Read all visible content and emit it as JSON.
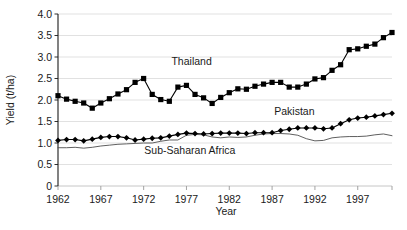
{
  "chart_data": {
    "type": "line",
    "title": "",
    "xlabel": "Year",
    "ylabel": "Yield (t/ha)",
    "xlim": [
      1962,
      2001
    ],
    "ylim": [
      0,
      4.0
    ],
    "grid": true,
    "grid_axis": "y",
    "legend": "inline-annotations",
    "y_ticks": [
      "0",
      "0.5",
      "1.0",
      "1.5",
      "2.0",
      "2.5",
      "3.0",
      "3.5",
      "4.0"
    ],
    "y_tick_values": [
      0,
      0.5,
      1.0,
      1.5,
      2.0,
      2.5,
      3.0,
      3.5,
      4.0
    ],
    "x_ticks": [
      "1962",
      "1967",
      "1972",
      "1977",
      "1982",
      "1987",
      "1992",
      "1997"
    ],
    "x_tick_values": [
      1962,
      1967,
      1972,
      1977,
      1982,
      1987,
      1992,
      1997
    ],
    "x": [
      1962,
      1963,
      1964,
      1965,
      1966,
      1967,
      1968,
      1969,
      1970,
      1971,
      1972,
      1973,
      1974,
      1975,
      1976,
      1977,
      1978,
      1979,
      1980,
      1981,
      1982,
      1983,
      1984,
      1985,
      1986,
      1987,
      1988,
      1989,
      1990,
      1991,
      1992,
      1993,
      1994,
      1995,
      1996,
      1997,
      1998,
      1999,
      2000,
      2001
    ],
    "series": [
      {
        "name": "Thailand",
        "marker": "square",
        "color": "#000000",
        "label_x": 1977.6,
        "label_y": 2.82,
        "values": [
          2.1,
          2.02,
          1.97,
          1.93,
          1.81,
          1.93,
          2.03,
          2.14,
          2.24,
          2.41,
          2.5,
          2.13,
          2.01,
          1.97,
          2.3,
          2.34,
          2.13,
          2.05,
          1.92,
          2.06,
          2.17,
          2.26,
          2.25,
          2.32,
          2.37,
          2.41,
          2.41,
          2.3,
          2.3,
          2.37,
          2.49,
          2.52,
          2.69,
          2.82,
          3.17,
          3.19,
          3.25,
          3.3,
          3.45,
          3.57
        ]
      },
      {
        "name": "Pakistan",
        "marker": "diamond",
        "color": "#000000",
        "label_x": 1989.6,
        "label_y": 1.65,
        "values": [
          1.06,
          1.08,
          1.08,
          1.05,
          1.09,
          1.13,
          1.15,
          1.15,
          1.12,
          1.07,
          1.09,
          1.11,
          1.12,
          1.16,
          1.2,
          1.23,
          1.22,
          1.21,
          1.22,
          1.23,
          1.23,
          1.23,
          1.22,
          1.24,
          1.24,
          1.24,
          1.29,
          1.32,
          1.35,
          1.35,
          1.35,
          1.33,
          1.35,
          1.45,
          1.54,
          1.58,
          1.6,
          1.63,
          1.66,
          1.69
        ]
      },
      {
        "name": "Sub-Saharan Africa",
        "marker": "none",
        "color": "#4d4d4d",
        "label_x": 1977.4,
        "label_y": 0.74,
        "values": [
          0.89,
          0.89,
          0.9,
          0.88,
          0.9,
          0.93,
          0.95,
          0.97,
          0.98,
          0.99,
          1.0,
          1.0,
          1.04,
          1.07,
          1.07,
          1.18,
          1.2,
          1.19,
          1.14,
          1.12,
          1.14,
          1.13,
          1.14,
          1.18,
          1.21,
          1.22,
          1.22,
          1.21,
          1.18,
          1.1,
          1.05,
          1.06,
          1.12,
          1.14,
          1.15,
          1.15,
          1.16,
          1.19,
          1.21,
          1.17
        ]
      }
    ]
  },
  "axes": {
    "y_label": "Yield (t/ha)",
    "x_label": "Year"
  },
  "colors": {
    "axis": "#1a1a1a",
    "grid": "#d9d9d9",
    "thailand": "#000000",
    "pakistan": "#000000",
    "africa": "#4d4d4d",
    "background": "#ffffff"
  }
}
